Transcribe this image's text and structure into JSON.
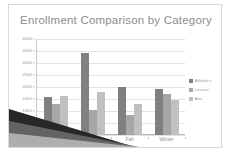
{
  "slide": {
    "background_color": "#ffffff",
    "border_color": "#d8d8d8",
    "decoration_name": "corner-swoosh",
    "decoration_colors": [
      "#2b2b2b",
      "#7a7a7a",
      "#d5d5d5"
    ]
  },
  "chart_data": {
    "type": "bar",
    "title": "Enrollment Comparison by Category",
    "xlabel": "",
    "ylabel": "",
    "categories": [
      "Spring",
      "Summer",
      "Fall",
      "Winter"
    ],
    "series": [
      {
        "name": "Athletics",
        "color": "#808080",
        "values": [
          1600,
          3430,
          2020,
          1920
        ]
      },
      {
        "name": "Leisure",
        "color": "#a6a6a6",
        "values": [
          1280,
          1060,
          850,
          1700
        ]
      },
      {
        "name": "Arts",
        "color": "#c0c0c0",
        "values": [
          1640,
          1790,
          1300,
          1470
        ]
      }
    ],
    "ylim": [
      0,
      4000
    ],
    "ytick_values": [
      4000,
      3500,
      3000,
      2500,
      2000,
      1500,
      1000,
      500,
      0
    ],
    "ytick_labels": [
      "4000",
      "3500",
      "3000",
      "2500",
      "2000",
      "1500",
      "1000",
      "500",
      "0"
    ],
    "grid": true,
    "gridline_color": "#e2e2e2",
    "legend_position": "right",
    "title_color": "#8c8c8c",
    "tick_label_color": "#9a9a9a"
  }
}
